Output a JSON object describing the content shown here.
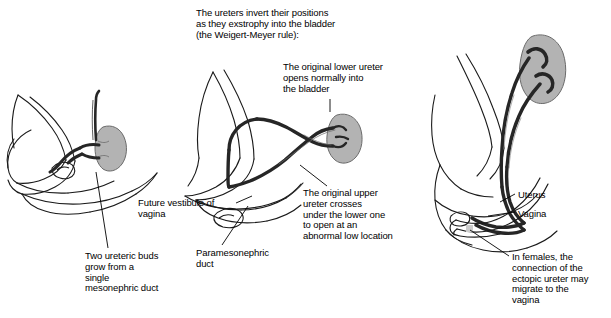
{
  "figure": {
    "type": "medical-illustration",
    "panels": [
      {
        "id": "left",
        "name": "ureteric-buds-panel",
        "description": "Embryo pelvis with single mesonephric duct giving rise to two ureteric buds entering a kidney"
      },
      {
        "id": "middle",
        "name": "ureter-inversion-panel",
        "description": "Ureters crossing as they exstrophy into the bladder, illustrating the Weigert-Meyer rule"
      },
      {
        "id": "right",
        "name": "female-ectopic-panel",
        "description": "Female pelvis with duplex kidney, uterus and vagina showing ectopic ureter migration"
      }
    ]
  },
  "captions": {
    "weigert": "The ureters invert their positions\nas they exstrophy into the bladder\n(the Weigert-Meyer rule):",
    "lower_ureter": "The original lower ureter\nopens normally into\nthe bladder",
    "upper_ureter": "The original upper\nureter crosses\nunder the lower one\nto open at an\nabnormal low location",
    "vestibule": "Future vestibule of\nvagina",
    "ureteric_buds": "Two ureteric buds\ngrow from a\nsingle\nmesonephric duct",
    "paramesonephric": "Paramesonephric\nduct",
    "uterus": "Uterus",
    "vagina": "Vagina",
    "females": "In females, the\nconnection of the\nectopic ureter may\nmigrate to the\nvagina"
  },
  "colors": {
    "background": "#ffffff",
    "outline": "#1a1a1a",
    "kidney_fill": "#b3b3b3",
    "kidney_stroke": "#4d4d4d",
    "ureter_dark": "#262626",
    "pelvis_fill": "#d9d9d9",
    "leader_line": "#000000"
  }
}
